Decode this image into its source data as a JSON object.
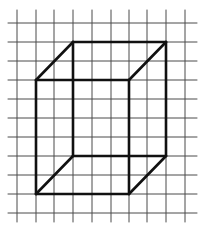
{
  "diagram": {
    "type": "cube-wireframe-on-grid",
    "grid": {
      "color": "#4a4a4a",
      "stroke_width": 1,
      "vertical_x": [
        17,
        36,
        54,
        73,
        92,
        111,
        129,
        147,
        166,
        185
      ],
      "horizontal_y": [
        23,
        42,
        61,
        80,
        99,
        118,
        137,
        156,
        175,
        194,
        213
      ],
      "x_extent": [
        8,
        197
      ],
      "y_extent": [
        10,
        222
      ]
    },
    "cube": {
      "color": "#111111",
      "stroke_width": 2.6,
      "vertices": {
        "front_top_left": [
          36,
          80
        ],
        "front_top_right": [
          129,
          80
        ],
        "front_bottom_left": [
          36,
          194
        ],
        "front_bottom_right": [
          129,
          194
        ],
        "back_top_left": [
          73,
          42
        ],
        "back_top_right": [
          166,
          42
        ],
        "back_bottom_left": [
          73,
          156
        ],
        "back_bottom_right": [
          166,
          156
        ]
      },
      "edges": [
        [
          "front_top_left",
          "front_top_right"
        ],
        [
          "front_top_right",
          "front_bottom_right"
        ],
        [
          "front_bottom_right",
          "front_bottom_left"
        ],
        [
          "front_bottom_left",
          "front_top_left"
        ],
        [
          "back_top_left",
          "back_top_right"
        ],
        [
          "back_top_right",
          "back_bottom_right"
        ],
        [
          "back_bottom_right",
          "back_bottom_left"
        ],
        [
          "back_bottom_left",
          "back_top_left"
        ],
        [
          "front_top_left",
          "back_top_left"
        ],
        [
          "front_top_right",
          "back_top_right"
        ],
        [
          "front_bottom_left",
          "back_bottom_left"
        ],
        [
          "front_bottom_right",
          "back_bottom_right"
        ]
      ]
    }
  }
}
